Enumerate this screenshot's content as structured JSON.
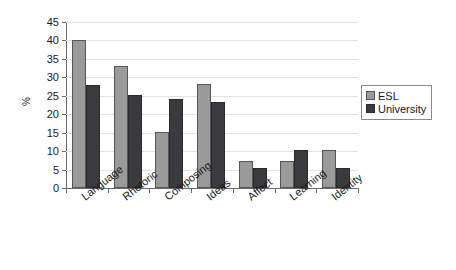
{
  "chart_data": {
    "type": "bar",
    "title": "",
    "subtitle": "",
    "xlabel": "",
    "ylabel": "%",
    "ylim": [
      0,
      45
    ],
    "ytick_step": 5,
    "yticks": [
      0,
      5,
      10,
      15,
      20,
      25,
      30,
      35,
      40,
      45
    ],
    "ytick_labels": [
      "0",
      "5",
      "10",
      "15",
      "20",
      "25",
      "30",
      "35",
      "40",
      "45"
    ],
    "grid": true,
    "grid_axis": "y",
    "legend_position": "right",
    "categories": [
      "Language",
      "Rhetoric",
      "Composing",
      "Ideas",
      "Affect",
      "Learning",
      "Identity"
    ],
    "series": [
      {
        "name": "ESL",
        "color": "#9a9a9a",
        "values": [
          40.0,
          33.0,
          15.2,
          28.1,
          7.3,
          7.3,
          10.3
        ]
      },
      {
        "name": "University",
        "color": "#3b3b3d",
        "values": [
          28.0,
          25.1,
          24.2,
          23.3,
          5.3,
          10.3,
          5.4
        ]
      }
    ],
    "legend": [
      "ESL",
      "University"
    ],
    "annotations": []
  },
  "colors": {
    "series_esl": "#9a9a9a",
    "series_university": "#3b3b3d",
    "axis": "#6b6b6b",
    "gridline": "#e2e2e2",
    "background": "#ffffff",
    "text": "#1a1a1a"
  }
}
